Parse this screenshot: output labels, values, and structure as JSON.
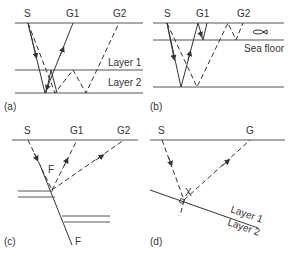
{
  "panels": {
    "a": {
      "caption": "(a)",
      "source": "S",
      "receivers": [
        "G1",
        "G2"
      ],
      "layers": [
        "Layer 1",
        "Layer 2"
      ]
    },
    "b": {
      "caption": "(b)",
      "source": "S",
      "receivers": [
        "G1",
        "G2"
      ],
      "interface": "Sea floor",
      "icon": "fish-icon"
    },
    "c": {
      "caption": "(c)",
      "source": "S",
      "receivers": [
        "G1",
        "G2"
      ],
      "fault_label_top": "F",
      "fault_label_bottom": "F"
    },
    "d": {
      "caption": "(d)",
      "source": "S",
      "receiver": "G",
      "reflection_point": "X",
      "layers": [
        "Layer 1",
        "Layer 2"
      ]
    }
  }
}
